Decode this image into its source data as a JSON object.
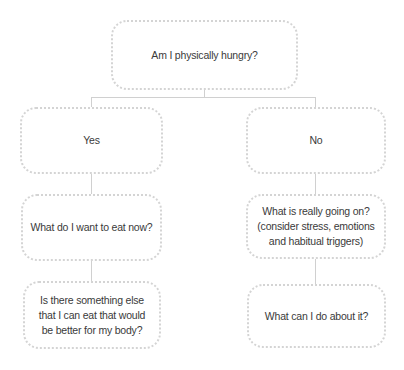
{
  "diagram": {
    "type": "decision-flowchart",
    "root": {
      "label": "Am I physically hungry?"
    },
    "branches": [
      {
        "label": "Yes",
        "steps": [
          "What do I want to eat now?",
          "Is there something else\nthat I can eat that would\nbe better for my body?"
        ]
      },
      {
        "label": "No",
        "steps": [
          "What is really going on?\n(consider stress, emotions\nand habitual triggers)",
          "What can I do about it?"
        ]
      }
    ],
    "colors": {
      "box_border": "#d4d4d4",
      "connector": "#d0d0d0",
      "text": "#3a3a3a",
      "background": "#ffffff"
    }
  }
}
